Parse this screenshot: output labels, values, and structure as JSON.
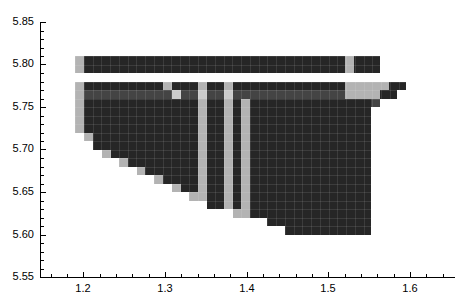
{
  "chart_data": {
    "type": "heatmap",
    "title": "",
    "subtitle": "",
    "xlabel": "",
    "ylabel": "",
    "grid": false,
    "legend": "none",
    "xlim": [
      1.147,
      1.655
    ],
    "ylim": [
      5.55,
      5.85
    ],
    "x_ticks": [
      1.2,
      1.3,
      1.4,
      1.5,
      1.6
    ],
    "x_tick_labels": [
      "1.2",
      "1.3",
      "1.4",
      "1.5",
      "1.6"
    ],
    "x_minor_step": 0.02,
    "y_ticks": [
      5.55,
      5.6,
      5.65,
      5.7,
      5.75,
      5.8,
      5.85
    ],
    "y_tick_labels": [
      "5.55",
      "5.60",
      "5.65",
      "5.70",
      "5.75",
      "5.80",
      "5.85"
    ],
    "y_minor_step": 0.01,
    "cell_width": 0.0107,
    "cell_height": 0.01,
    "colors": {
      "dark": "#262626",
      "mid": "#444444",
      "light": "#b3b3b3",
      "pale": "#cccccc",
      "background": "#ffffff",
      "axis": "#000000"
    },
    "value_levels": {
      "dark": 3,
      "mid": 2,
      "light": 1,
      "pale": 1,
      "background": 0
    },
    "rows": [
      {
        "y": 5.8,
        "runs": [
          {
            "x0": 1.19,
            "x1": 1.201,
            "c": "light"
          },
          {
            "x0": 1.201,
            "x1": 1.52,
            "c": "dark"
          },
          {
            "x0": 1.52,
            "x1": 1.531,
            "c": "light"
          },
          {
            "x0": 1.531,
            "x1": 1.563,
            "c": "dark"
          }
        ]
      },
      {
        "y": 5.79,
        "runs": [
          {
            "x0": 1.19,
            "x1": 1.201,
            "c": "light"
          },
          {
            "x0": 1.201,
            "x1": 1.52,
            "c": "dark"
          },
          {
            "x0": 1.52,
            "x1": 1.531,
            "c": "light"
          },
          {
            "x0": 1.531,
            "x1": 1.563,
            "c": "dark"
          }
        ]
      },
      {
        "y": 5.78,
        "runs": []
      },
      {
        "y": 5.77,
        "runs": [
          {
            "x0": 1.19,
            "x1": 1.201,
            "c": "light"
          },
          {
            "x0": 1.201,
            "x1": 1.297,
            "c": "dark"
          },
          {
            "x0": 1.297,
            "x1": 1.308,
            "c": "light"
          },
          {
            "x0": 1.308,
            "x1": 1.34,
            "c": "dark"
          },
          {
            "x0": 1.34,
            "x1": 1.351,
            "c": "light"
          },
          {
            "x0": 1.351,
            "x1": 1.372,
            "c": "dark"
          },
          {
            "x0": 1.372,
            "x1": 1.383,
            "c": "light"
          },
          {
            "x0": 1.383,
            "x1": 1.52,
            "c": "dark"
          },
          {
            "x0": 1.52,
            "x1": 1.574,
            "c": "light"
          },
          {
            "x0": 1.574,
            "x1": 1.595,
            "c": "dark"
          }
        ]
      },
      {
        "y": 5.76,
        "runs": [
          {
            "x0": 1.19,
            "x1": 1.201,
            "c": "light"
          },
          {
            "x0": 1.201,
            "x1": 1.308,
            "c": "mid"
          },
          {
            "x0": 1.308,
            "x1": 1.319,
            "c": "pale"
          },
          {
            "x0": 1.319,
            "x1": 1.34,
            "c": "mid"
          },
          {
            "x0": 1.34,
            "x1": 1.351,
            "c": "pale"
          },
          {
            "x0": 1.351,
            "x1": 1.372,
            "c": "mid"
          },
          {
            "x0": 1.372,
            "x1": 1.383,
            "c": "pale"
          },
          {
            "x0": 1.383,
            "x1": 1.52,
            "c": "mid"
          },
          {
            "x0": 1.52,
            "x1": 1.563,
            "c": "light"
          },
          {
            "x0": 1.563,
            "x1": 1.584,
            "c": "dark"
          }
        ]
      },
      {
        "y": 5.75,
        "runs": [
          {
            "x0": 1.19,
            "x1": 1.201,
            "c": "light"
          },
          {
            "x0": 1.201,
            "x1": 1.34,
            "c": "dark"
          },
          {
            "x0": 1.34,
            "x1": 1.351,
            "c": "light"
          },
          {
            "x0": 1.351,
            "x1": 1.372,
            "c": "dark"
          },
          {
            "x0": 1.372,
            "x1": 1.383,
            "c": "light"
          },
          {
            "x0": 1.383,
            "x1": 1.393,
            "c": "dark"
          },
          {
            "x0": 1.393,
            "x1": 1.404,
            "c": "light"
          },
          {
            "x0": 1.404,
            "x1": 1.552,
            "c": "dark"
          },
          {
            "x0": 1.552,
            "x1": 1.563,
            "c": "mid"
          }
        ]
      },
      {
        "y": 5.74,
        "runs": [
          {
            "x0": 1.19,
            "x1": 1.201,
            "c": "light"
          },
          {
            "x0": 1.201,
            "x1": 1.34,
            "c": "dark"
          },
          {
            "x0": 1.34,
            "x1": 1.351,
            "c": "light"
          },
          {
            "x0": 1.351,
            "x1": 1.372,
            "c": "dark"
          },
          {
            "x0": 1.372,
            "x1": 1.383,
            "c": "light"
          },
          {
            "x0": 1.383,
            "x1": 1.393,
            "c": "dark"
          },
          {
            "x0": 1.393,
            "x1": 1.404,
            "c": "light"
          },
          {
            "x0": 1.404,
            "x1": 1.552,
            "c": "dark"
          }
        ]
      },
      {
        "y": 5.73,
        "runs": [
          {
            "x0": 1.19,
            "x1": 1.201,
            "c": "light"
          },
          {
            "x0": 1.201,
            "x1": 1.34,
            "c": "dark"
          },
          {
            "x0": 1.34,
            "x1": 1.351,
            "c": "light"
          },
          {
            "x0": 1.351,
            "x1": 1.372,
            "c": "dark"
          },
          {
            "x0": 1.372,
            "x1": 1.383,
            "c": "light"
          },
          {
            "x0": 1.383,
            "x1": 1.393,
            "c": "dark"
          },
          {
            "x0": 1.393,
            "x1": 1.404,
            "c": "light"
          },
          {
            "x0": 1.404,
            "x1": 1.552,
            "c": "dark"
          }
        ]
      },
      {
        "y": 5.72,
        "runs": [
          {
            "x0": 1.19,
            "x1": 1.201,
            "c": "light"
          },
          {
            "x0": 1.201,
            "x1": 1.34,
            "c": "dark"
          },
          {
            "x0": 1.34,
            "x1": 1.351,
            "c": "light"
          },
          {
            "x0": 1.351,
            "x1": 1.372,
            "c": "dark"
          },
          {
            "x0": 1.372,
            "x1": 1.383,
            "c": "light"
          },
          {
            "x0": 1.383,
            "x1": 1.393,
            "c": "dark"
          },
          {
            "x0": 1.393,
            "x1": 1.404,
            "c": "light"
          },
          {
            "x0": 1.404,
            "x1": 1.552,
            "c": "dark"
          }
        ]
      },
      {
        "y": 5.71,
        "runs": [
          {
            "x0": 1.201,
            "x1": 1.212,
            "c": "light"
          },
          {
            "x0": 1.212,
            "x1": 1.34,
            "c": "dark"
          },
          {
            "x0": 1.34,
            "x1": 1.351,
            "c": "light"
          },
          {
            "x0": 1.351,
            "x1": 1.372,
            "c": "dark"
          },
          {
            "x0": 1.372,
            "x1": 1.383,
            "c": "light"
          },
          {
            "x0": 1.383,
            "x1": 1.393,
            "c": "dark"
          },
          {
            "x0": 1.393,
            "x1": 1.404,
            "c": "light"
          },
          {
            "x0": 1.404,
            "x1": 1.552,
            "c": "dark"
          }
        ]
      },
      {
        "y": 5.7,
        "runs": [
          {
            "x0": 1.212,
            "x1": 1.34,
            "c": "dark"
          },
          {
            "x0": 1.34,
            "x1": 1.351,
            "c": "light"
          },
          {
            "x0": 1.351,
            "x1": 1.372,
            "c": "dark"
          },
          {
            "x0": 1.372,
            "x1": 1.383,
            "c": "light"
          },
          {
            "x0": 1.383,
            "x1": 1.393,
            "c": "dark"
          },
          {
            "x0": 1.393,
            "x1": 1.404,
            "c": "light"
          },
          {
            "x0": 1.404,
            "x1": 1.552,
            "c": "dark"
          }
        ]
      },
      {
        "y": 5.69,
        "runs": [
          {
            "x0": 1.223,
            "x1": 1.234,
            "c": "light"
          },
          {
            "x0": 1.234,
            "x1": 1.34,
            "c": "dark"
          },
          {
            "x0": 1.34,
            "x1": 1.351,
            "c": "light"
          },
          {
            "x0": 1.351,
            "x1": 1.372,
            "c": "dark"
          },
          {
            "x0": 1.372,
            "x1": 1.383,
            "c": "light"
          },
          {
            "x0": 1.383,
            "x1": 1.393,
            "c": "dark"
          },
          {
            "x0": 1.393,
            "x1": 1.404,
            "c": "light"
          },
          {
            "x0": 1.404,
            "x1": 1.552,
            "c": "dark"
          }
        ]
      },
      {
        "y": 5.68,
        "runs": [
          {
            "x0": 1.244,
            "x1": 1.255,
            "c": "light"
          },
          {
            "x0": 1.255,
            "x1": 1.34,
            "c": "dark"
          },
          {
            "x0": 1.34,
            "x1": 1.351,
            "c": "light"
          },
          {
            "x0": 1.351,
            "x1": 1.372,
            "c": "dark"
          },
          {
            "x0": 1.372,
            "x1": 1.383,
            "c": "light"
          },
          {
            "x0": 1.383,
            "x1": 1.393,
            "c": "dark"
          },
          {
            "x0": 1.393,
            "x1": 1.404,
            "c": "light"
          },
          {
            "x0": 1.404,
            "x1": 1.552,
            "c": "dark"
          }
        ]
      },
      {
        "y": 5.67,
        "runs": [
          {
            "x0": 1.266,
            "x1": 1.276,
            "c": "light"
          },
          {
            "x0": 1.276,
            "x1": 1.34,
            "c": "dark"
          },
          {
            "x0": 1.34,
            "x1": 1.351,
            "c": "light"
          },
          {
            "x0": 1.351,
            "x1": 1.372,
            "c": "dark"
          },
          {
            "x0": 1.372,
            "x1": 1.383,
            "c": "light"
          },
          {
            "x0": 1.383,
            "x1": 1.393,
            "c": "dark"
          },
          {
            "x0": 1.393,
            "x1": 1.404,
            "c": "light"
          },
          {
            "x0": 1.404,
            "x1": 1.552,
            "c": "dark"
          }
        ]
      },
      {
        "y": 5.66,
        "runs": [
          {
            "x0": 1.287,
            "x1": 1.297,
            "c": "light"
          },
          {
            "x0": 1.297,
            "x1": 1.34,
            "c": "dark"
          },
          {
            "x0": 1.34,
            "x1": 1.351,
            "c": "light"
          },
          {
            "x0": 1.351,
            "x1": 1.372,
            "c": "dark"
          },
          {
            "x0": 1.372,
            "x1": 1.383,
            "c": "light"
          },
          {
            "x0": 1.383,
            "x1": 1.393,
            "c": "dark"
          },
          {
            "x0": 1.393,
            "x1": 1.404,
            "c": "light"
          },
          {
            "x0": 1.404,
            "x1": 1.552,
            "c": "dark"
          }
        ]
      },
      {
        "y": 5.65,
        "runs": [
          {
            "x0": 1.308,
            "x1": 1.319,
            "c": "light"
          },
          {
            "x0": 1.319,
            "x1": 1.34,
            "c": "dark"
          },
          {
            "x0": 1.34,
            "x1": 1.351,
            "c": "light"
          },
          {
            "x0": 1.351,
            "x1": 1.372,
            "c": "dark"
          },
          {
            "x0": 1.372,
            "x1": 1.383,
            "c": "light"
          },
          {
            "x0": 1.383,
            "x1": 1.393,
            "c": "dark"
          },
          {
            "x0": 1.393,
            "x1": 1.404,
            "c": "light"
          },
          {
            "x0": 1.404,
            "x1": 1.552,
            "c": "dark"
          }
        ]
      },
      {
        "y": 5.64,
        "runs": [
          {
            "x0": 1.329,
            "x1": 1.34,
            "c": "light"
          },
          {
            "x0": 1.34,
            "x1": 1.351,
            "c": "light"
          },
          {
            "x0": 1.351,
            "x1": 1.372,
            "c": "dark"
          },
          {
            "x0": 1.372,
            "x1": 1.383,
            "c": "light"
          },
          {
            "x0": 1.383,
            "x1": 1.393,
            "c": "dark"
          },
          {
            "x0": 1.393,
            "x1": 1.404,
            "c": "light"
          },
          {
            "x0": 1.404,
            "x1": 1.552,
            "c": "dark"
          }
        ]
      },
      {
        "y": 5.63,
        "runs": [
          {
            "x0": 1.351,
            "x1": 1.372,
            "c": "dark"
          },
          {
            "x0": 1.372,
            "x1": 1.383,
            "c": "light"
          },
          {
            "x0": 1.383,
            "x1": 1.393,
            "c": "dark"
          },
          {
            "x0": 1.393,
            "x1": 1.404,
            "c": "light"
          },
          {
            "x0": 1.404,
            "x1": 1.552,
            "c": "dark"
          }
        ]
      },
      {
        "y": 5.62,
        "runs": [
          {
            "x0": 1.383,
            "x1": 1.393,
            "c": "light"
          },
          {
            "x0": 1.393,
            "x1": 1.404,
            "c": "light"
          },
          {
            "x0": 1.404,
            "x1": 1.552,
            "c": "dark"
          }
        ]
      },
      {
        "y": 5.61,
        "runs": [
          {
            "x0": 1.425,
            "x1": 1.552,
            "c": "dark"
          }
        ]
      },
      {
        "y": 5.6,
        "runs": [
          {
            "x0": 1.447,
            "x1": 1.552,
            "c": "dark"
          }
        ]
      }
    ]
  }
}
